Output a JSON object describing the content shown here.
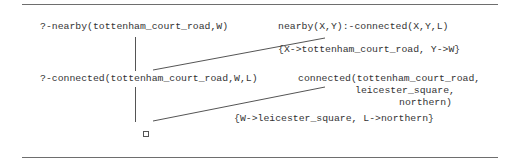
{
  "diagram": {
    "type": "SLD resolution tree",
    "goals": [
      "?-nearby(tottenham_court_road,W)",
      "?-connected(tottenham_court_road,W,L)"
    ],
    "clauses": [
      "nearby(X,Y):-connected(X,Y,L)",
      {
        "line1": "connected(tottenham_court_road,",
        "line2": "leicester_square,",
        "line3": "northern)"
      }
    ],
    "substitutions": [
      "{X->tottenham_court_road, Y->W}",
      "{W->leicester_square, L->northern}"
    ],
    "empty_clause_symbol": "□",
    "colors": {
      "text": "#333333",
      "lines": "#555555",
      "rules": "#6e6e6e",
      "background": "#ffffff"
    }
  }
}
